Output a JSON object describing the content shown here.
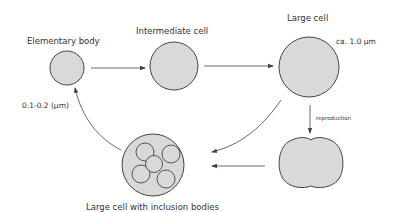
{
  "diagram": {
    "type": "life-cycle",
    "nodes": [
      {
        "id": "elementary",
        "label": "Elementary body",
        "size_note": "0.1-0.2 (μm)"
      },
      {
        "id": "intermediate",
        "label": "Intermediate cell"
      },
      {
        "id": "large",
        "label": "Large cell",
        "size_note": "ca. 1.0 μm"
      },
      {
        "id": "dividing",
        "label": ""
      },
      {
        "id": "inclusion",
        "label": "Large cell with inclusion bodies"
      }
    ],
    "edges": [
      {
        "from": "elementary",
        "to": "intermediate",
        "label": ""
      },
      {
        "from": "intermediate",
        "to": "large",
        "label": ""
      },
      {
        "from": "large",
        "to": "dividing",
        "label": "reproduction"
      },
      {
        "from": "large",
        "to": "inclusion",
        "label": ""
      },
      {
        "from": "dividing",
        "to": "inclusion",
        "label": ""
      },
      {
        "from": "inclusion",
        "to": "elementary",
        "label": ""
      }
    ],
    "colors": {
      "cell_fill": "#d9d9d9",
      "stroke": "#444444",
      "text": "#333333"
    }
  }
}
